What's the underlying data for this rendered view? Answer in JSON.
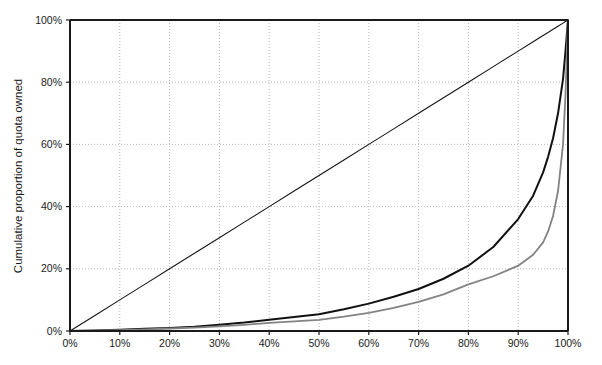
{
  "chart_data": {
    "type": "line",
    "title": "",
    "xlabel": "",
    "ylabel": "Cumulative proportion of quota owned",
    "xlim": [
      0,
      100
    ],
    "ylim": [
      0,
      100
    ],
    "grid": true,
    "legend": "none",
    "x_tick_labels": [
      "0%",
      "10%",
      "20%",
      "30%",
      "40%",
      "50%",
      "60%",
      "70%",
      "80%",
      "90%",
      "100%"
    ],
    "x_tick_values": [
      0,
      10,
      20,
      30,
      40,
      50,
      60,
      70,
      80,
      90,
      100
    ],
    "y_tick_labels": [
      "0%",
      "20%",
      "40%",
      "60%",
      "80%",
      "100%"
    ],
    "y_tick_values": [
      0,
      20,
      40,
      60,
      80,
      100
    ],
    "x": [
      0,
      5,
      10,
      15,
      20,
      25,
      30,
      35,
      40,
      45,
      50,
      55,
      60,
      65,
      70,
      75,
      80,
      85,
      90,
      93,
      95,
      96,
      97,
      98,
      99,
      99.5,
      100
    ],
    "series": [
      {
        "name": "Line of equality",
        "color": "#151515",
        "linewidth": 1.1,
        "values": [
          0,
          5,
          10,
          15,
          20,
          25,
          30,
          35,
          40,
          45,
          50,
          55,
          60,
          65,
          70,
          75,
          80,
          85,
          90,
          93,
          95,
          96,
          97,
          98,
          99,
          99.5,
          100
        ]
      },
      {
        "name": "Lorenz curve (black)",
        "color": "#111111",
        "linewidth": 2.0,
        "values": [
          0,
          0.2,
          0.4,
          0.7,
          1.0,
          1.4,
          2.0,
          2.7,
          3.6,
          4.5,
          5.4,
          7.0,
          8.8,
          11.0,
          13.5,
          16.8,
          21.0,
          27.0,
          36.0,
          43.5,
          51.0,
          56.0,
          62.0,
          70.0,
          81.0,
          90.0,
          100
        ]
      },
      {
        "name": "Lorenz curve (grey)",
        "color": "#838383",
        "linewidth": 1.8,
        "values": [
          0,
          0.15,
          0.3,
          0.5,
          0.8,
          1.1,
          1.5,
          2.0,
          2.6,
          3.1,
          3.6,
          4.6,
          5.8,
          7.4,
          9.4,
          11.8,
          15.0,
          17.6,
          21.0,
          24.5,
          28.5,
          32.0,
          37.0,
          45.0,
          60.0,
          76.0,
          100
        ]
      }
    ]
  },
  "plot": {
    "left_px": 70,
    "right_px": 568,
    "top_px": 20,
    "bottom_px": 331,
    "frame_color": "#1a1a1a",
    "grid_color": "#b8b8b8",
    "background": "#ffffff"
  }
}
